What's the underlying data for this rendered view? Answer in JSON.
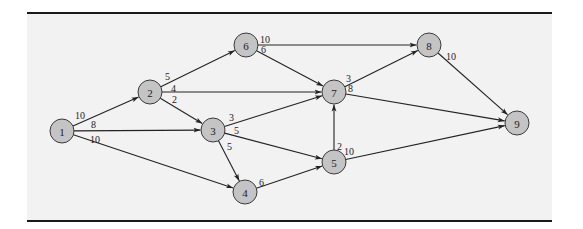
{
  "diagram": {
    "type": "directed-network",
    "nodes": [
      {
        "id": "1",
        "label": "1",
        "x": 62,
        "y": 131
      },
      {
        "id": "2",
        "label": "2",
        "x": 150,
        "y": 92
      },
      {
        "id": "3",
        "label": "3",
        "x": 213,
        "y": 130
      },
      {
        "id": "4",
        "label": "4",
        "x": 245,
        "y": 192
      },
      {
        "id": "5",
        "label": "5",
        "x": 334,
        "y": 162
      },
      {
        "id": "6",
        "label": "6",
        "x": 246,
        "y": 45
      },
      {
        "id": "7",
        "label": "7",
        "x": 334,
        "y": 92
      },
      {
        "id": "8",
        "label": "8",
        "x": 429,
        "y": 45
      },
      {
        "id": "9",
        "label": "9",
        "x": 517,
        "y": 123
      }
    ],
    "edges": [
      {
        "from": "1",
        "to": "2",
        "weight": "10",
        "lx": 75,
        "ly": 119
      },
      {
        "from": "1",
        "to": "3",
        "weight": "8",
        "lx": 91,
        "ly": 128
      },
      {
        "from": "1",
        "to": "4",
        "weight": "10",
        "lx": 90,
        "ly": 143
      },
      {
        "from": "2",
        "to": "6",
        "weight": "5",
        "lx": 165,
        "ly": 80
      },
      {
        "from": "2",
        "to": "7",
        "weight": "4",
        "lx": 171,
        "ly": 92
      },
      {
        "from": "2",
        "to": "3",
        "weight": "2",
        "lx": 172,
        "ly": 103
      },
      {
        "from": "3",
        "to": "7",
        "weight": "3",
        "lx": 229,
        "ly": 121
      },
      {
        "from": "3",
        "to": "5",
        "weight": "5",
        "lx": 234,
        "ly": 134
      },
      {
        "from": "3",
        "to": "4",
        "weight": "5",
        "lx": 227,
        "ly": 150
      },
      {
        "from": "4",
        "to": "5",
        "weight": "6",
        "lx": 259,
        "ly": 186
      },
      {
        "from": "5",
        "to": "7",
        "weight": "2",
        "lx": 337,
        "ly": 150
      },
      {
        "from": "5",
        "to": "9",
        "weight": "10",
        "lx": 344,
        "ly": 155
      },
      {
        "from": "6",
        "to": "8",
        "weight": "10",
        "lx": 260,
        "ly": 43
      },
      {
        "from": "6",
        "to": "7",
        "weight": "6",
        "lx": 261,
        "ly": 53
      },
      {
        "from": "7",
        "to": "8",
        "weight": "3",
        "lx": 346,
        "ly": 82
      },
      {
        "from": "7",
        "to": "9",
        "weight": "8",
        "lx": 348,
        "ly": 92
      },
      {
        "from": "8",
        "to": "9",
        "weight": "10",
        "lx": 446,
        "ly": 60
      }
    ]
  },
  "colors": {
    "background": "#f2f2f2",
    "node_fill": "#c4c4c4",
    "rule": "#1a1a1a"
  }
}
